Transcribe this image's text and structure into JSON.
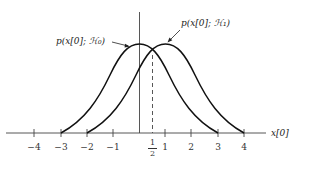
{
  "diagram": {
    "title": "",
    "x_axis_label": "x[0]",
    "curves": [
      {
        "name": "H0",
        "label": "p(x[0]; ℋ₀)",
        "mean": 0,
        "support": [
          -3,
          3
        ]
      },
      {
        "name": "H1",
        "label": "p(x[0]; ℋ₁)",
        "mean": 1,
        "support": [
          -2,
          4
        ]
      }
    ],
    "threshold": {
      "value": 0.5,
      "label_num": "1",
      "label_den": "2",
      "style": "dashed"
    },
    "ticks": [
      {
        "value": -4,
        "label": "−4"
      },
      {
        "value": -3,
        "label": "−3"
      },
      {
        "value": -2,
        "label": "−2"
      },
      {
        "value": -1,
        "label": "−1"
      },
      {
        "value": 1,
        "label": "1"
      },
      {
        "value": 2,
        "label": "2"
      },
      {
        "value": 3,
        "label": "3"
      },
      {
        "value": 4,
        "label": "4"
      }
    ]
  }
}
